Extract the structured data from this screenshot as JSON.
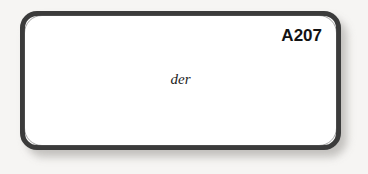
{
  "figure": {
    "id_label": "A207",
    "content_word": "der",
    "frame": {
      "fill_color": "#ffffff",
      "border_color": "#3b3b3b",
      "shadow_color": "#b9b7b4"
    },
    "background_color": "#f6f5f3",
    "text_color": "#131313"
  }
}
